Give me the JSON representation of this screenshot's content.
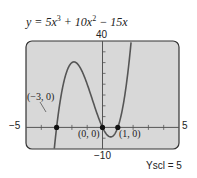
{
  "chart_data": {
    "type": "line",
    "equation": {
      "lhs": "y",
      "terms": [
        "5x",
        "3",
        " + 10x",
        "2",
        " − 15x"
      ]
    },
    "function": "5*x^3 + 10*x^2 - 15*x",
    "xlim": [
      -5,
      5
    ],
    "ylim": [
      -10,
      40
    ],
    "xscl": 1,
    "yscl": 5,
    "grid": false,
    "axis_labels": {
      "xmin": "−5",
      "xmax": "5",
      "ymax": "40",
      "ymin": "−10"
    },
    "yscl_label": "Yscl = 5",
    "annotated_points": [
      {
        "x": -3,
        "y": 0,
        "label": "(−3, 0)"
      },
      {
        "x": 0,
        "y": 0,
        "label": "(0, 0)"
      },
      {
        "x": 1,
        "y": 0,
        "label": "(1, 0)"
      }
    ],
    "local_max": {
      "x": -1.87,
      "y": 30.3
    },
    "local_min": {
      "x": 0.53,
      "y": -4.3
    }
  },
  "colors": {
    "plot_bg": "#d8d8d8",
    "frame": "#333333",
    "curve": "#555555",
    "axis": "#555555"
  }
}
